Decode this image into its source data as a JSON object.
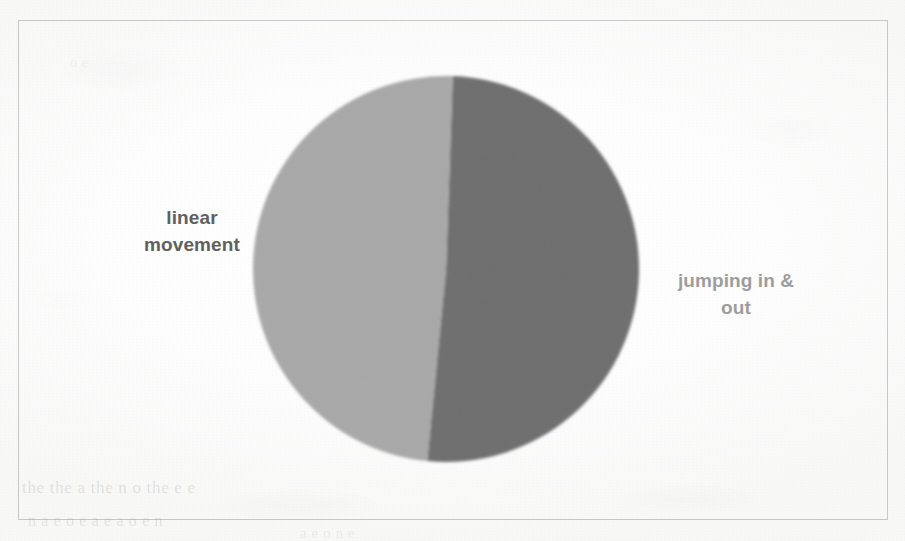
{
  "page": {
    "kind": "scanned-document-figure",
    "background_color": "#fcfcfc",
    "frame_color": "#78787c"
  },
  "figure": {
    "frame_present": true
  },
  "bleed_through_text": {
    "line_1": "the the  a the  n  o the   e   e",
    "line_2": "n a e o    e   a   e   a  o e  n",
    "line_3": "a   e o    n   e",
    "line_4": "e   a",
    "line_5": "o   e"
  },
  "chart_data": {
    "type": "pie",
    "title": "",
    "labels": [
      "linear movement",
      "jumping in & out"
    ],
    "values": [
      51,
      49
    ],
    "unit": "%",
    "colors": [
      "#6e6e6e",
      "#a8a8a8"
    ],
    "start_angle_deg": 2,
    "legend": "none",
    "data_labels": "outside-callout",
    "slices": [
      {
        "name": "linear movement",
        "label": "linear\nmovement",
        "value": 51,
        "color": "#6e6e6e",
        "label_color": "#60605f",
        "label_position": "left"
      },
      {
        "name": "jumping in & out",
        "label": "jumping in &\nout",
        "value": 49,
        "color": "#a8a8a8",
        "label_color": "#9d9d9c",
        "label_position": "right"
      }
    ]
  }
}
